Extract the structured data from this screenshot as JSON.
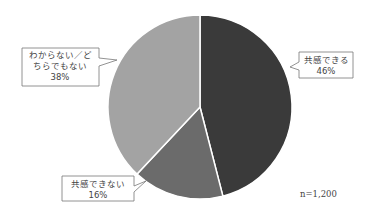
{
  "chart_data": {
    "type": "pie",
    "title": "",
    "sample_size_label": "n=1,200",
    "start_angle_deg": 0,
    "direction": "clockwise",
    "slices": [
      {
        "label": "共感できる",
        "value": 46,
        "value_label": "46%",
        "color": "#3a3a3a"
      },
      {
        "label": "共感できない",
        "value": 16,
        "value_label": "16%",
        "color": "#6b6b6b"
      },
      {
        "label": "わからない／どちらでもない",
        "value": 38,
        "value_label": "38%",
        "color": "#a3a3a3"
      }
    ],
    "categories": [
      "共感できる",
      "共感できない",
      "わからない／どちらでもない"
    ],
    "values": [
      46,
      16,
      38
    ],
    "legend": "callout labels (no separate legend)"
  },
  "callouts": [
    {
      "lines": [
        "共感できる",
        "46%"
      ]
    },
    {
      "lines": [
        "共感できない",
        "16%"
      ]
    },
    {
      "lines": [
        "わからない／ど",
        "ちらでもない",
        "38%"
      ]
    }
  ],
  "note": "n=1,200"
}
